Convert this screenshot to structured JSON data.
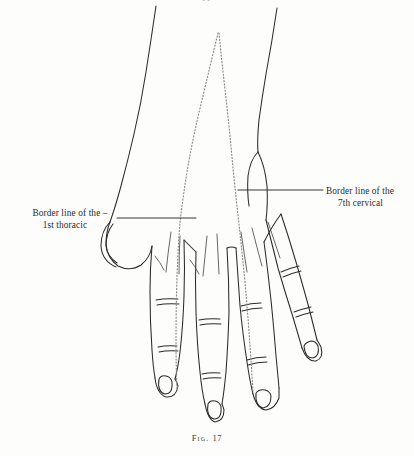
{
  "figure": {
    "caption_prefix": "Fig.",
    "caption_number": "17",
    "top_artifact": "••",
    "ink_color": "#2b2b2b",
    "background_color": "#fdfdfc",
    "dotted_line_color": "#8a8a8a"
  },
  "annotations": {
    "left": {
      "line1": "Border line of the –",
      "line2": "1st thoracic",
      "leader": {
        "x1": 117,
        "y1": 218,
        "x2": 196,
        "y2": 218
      }
    },
    "right": {
      "line1": "Border line of the",
      "line2": "7th cervical",
      "leader": {
        "x1": 238,
        "y1": 190,
        "x2": 323,
        "y2": 190
      }
    }
  }
}
